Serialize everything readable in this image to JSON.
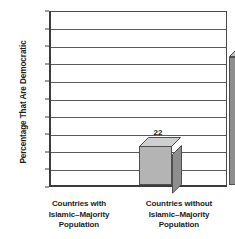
{
  "chart_data": {
    "type": "bar",
    "title": "",
    "subtitle": "",
    "xlabel": "",
    "ylabel": "Percentage That Are Democratic",
    "categories": [
      "Countries with Islamic–Majority Population",
      "Countries without Islamic–Majority Population"
    ],
    "category_lines": [
      [
        "Countries with",
        "Islamic–Majority",
        "Population"
      ],
      [
        "Countries without",
        "Islamic–Majority",
        "Population"
      ]
    ],
    "values": [
      22,
      73
    ],
    "value_labels": [
      "22",
      "73"
    ],
    "ylim": [
      0,
      100
    ],
    "ytick_step": 10,
    "yticks": [
      "100",
      "90",
      "80",
      "70",
      "60",
      "50",
      "40",
      "30",
      "20",
      "10",
      "0"
    ],
    "grid": true,
    "grid_axis": "y",
    "legend": "none",
    "style": "3d-bars",
    "colors": {
      "bar_one_front": "#b4b4b4",
      "bar_one_top": "#cfcfcf",
      "bar_one_side": "#8e8e8e",
      "bar_two_front": "#8e8e8e",
      "bar_two_top": "#bdbdbd",
      "bar_two_side": "#6d6d6d",
      "outline": "#4f4f4f",
      "axis": "#3b3b3b",
      "gridline": "#5a5a5a",
      "text": "#1c1c1c",
      "background": "#ffffff"
    }
  }
}
